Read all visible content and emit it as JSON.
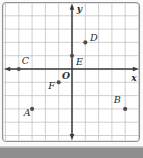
{
  "figure": {
    "kind": "coordinate-plane scatter of labeled points",
    "bottom_strip": "gray divider band below figure"
  },
  "chart_data": {
    "type": "scatter",
    "title": "",
    "xlabel": "x",
    "ylabel": "y",
    "origin_label": "O",
    "xlim": [
      -5,
      5
    ],
    "ylim": [
      -5,
      5
    ],
    "grid": true,
    "tick_labels_shown": false,
    "points": [
      {
        "label": "A",
        "x": -3,
        "y": -3,
        "label_offset": {
          "dx": -5.0,
          "dy": 7.5
        }
      },
      {
        "label": "B",
        "x": 4,
        "y": -3,
        "label_offset": {
          "dx": -8.0,
          "dy": -5.5
        }
      },
      {
        "label": "C",
        "x": -4,
        "y": 0,
        "label_offset": {
          "dx": 6.5,
          "dy": -5.0
        }
      },
      {
        "label": "D",
        "x": 1,
        "y": 2,
        "label_offset": {
          "dx": 8.5,
          "dy": -1.5
        }
      },
      {
        "label": "E",
        "x": 0,
        "y": 1,
        "label_offset": {
          "dx": 7.5,
          "dy": 9.5
        }
      },
      {
        "label": "F",
        "x": -1,
        "y": -1,
        "label_offset": {
          "dx": -7.0,
          "dy": 7.0
        }
      }
    ]
  },
  "colors": {
    "page_bg": "#fafafa",
    "panel_bg": "#ffffff",
    "panel_border": "#949494",
    "grid_line": "#c9c9c9",
    "axis": "#3b3b3b",
    "point": "#4d4d4d",
    "label": "#2d2d2d",
    "bottom_strip": "#8e8e8e"
  }
}
